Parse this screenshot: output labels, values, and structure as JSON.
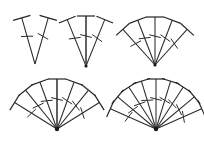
{
  "figure": {
    "background_color": "#ffffff",
    "stroke_color": "#2b2b2b",
    "emphasis_stroke_color": "#5a5a5a",
    "width": 204,
    "height": 168
  },
  "chart_data": {
    "type": "diagram",
    "categories": [
      "cluster-1",
      "cluster-2",
      "cluster-3",
      "cluster-4",
      "cluster-5"
    ],
    "values": [
      2,
      3,
      5,
      7,
      9
    ],
    "xlabel": "",
    "ylabel": "",
    "grid": false,
    "legend": "none"
  },
  "clusters": [
    {
      "id": "cluster-1",
      "label": "2-nail fan",
      "count": 2,
      "apex": {
        "x": 35,
        "y": 64
      },
      "shaft_length": 48,
      "head_half": 9,
      "barb_half": 6,
      "barb_ratio": 0.6,
      "angles": [
        -106,
        -74
      ],
      "emphasis_index": -1
    },
    {
      "id": "cluster-2",
      "label": "3-nail fan",
      "count": 3,
      "apex": {
        "x": 86,
        "y": 66
      },
      "shaft_length": 50,
      "head_half": 9,
      "barb_half": 6,
      "barb_ratio": 0.6,
      "angles": [
        -112,
        -90,
        -68
      ],
      "emphasis_index": 1
    },
    {
      "id": "cluster-3",
      "label": "5-nail fan",
      "count": 5,
      "apex": {
        "x": 155,
        "y": 65
      },
      "shaft_length": 48,
      "head_half": 9,
      "barb_half": 6,
      "barb_ratio": 0.6,
      "angles": [
        -132,
        -111,
        -90,
        -69,
        -48
      ],
      "emphasis_index": -1
    },
    {
      "id": "cluster-4",
      "label": "7-nail fan",
      "count": 7,
      "apex": {
        "x": 57,
        "y": 129
      },
      "shaft_length": 50,
      "head_half": 9,
      "barb_half": 6,
      "barb_ratio": 0.6,
      "angles": [
        -148,
        -129,
        -110,
        -90,
        -70,
        -51,
        -32
      ],
      "emphasis_index": 3
    },
    {
      "id": "cluster-5",
      "label": "9-nail fan",
      "count": 9,
      "apex": {
        "x": 156,
        "y": 129
      },
      "shaft_length": 50,
      "head_half": 9,
      "barb_half": 6,
      "barb_ratio": 0.6,
      "angles": [
        -156,
        -140,
        -123,
        -107,
        -90,
        -73,
        -57,
        -40,
        -24
      ],
      "emphasis_index": -1
    }
  ]
}
